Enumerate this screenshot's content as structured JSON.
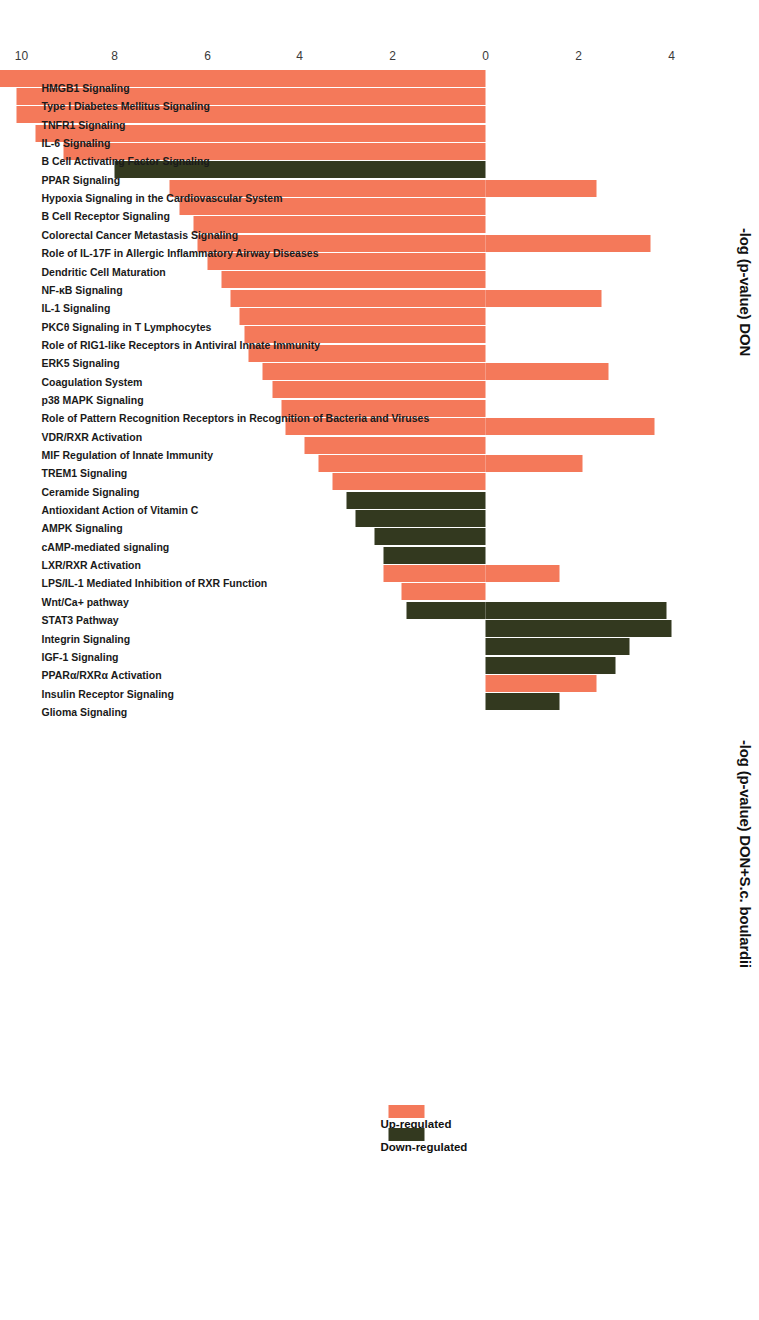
{
  "figure": {
    "left_axis_title": "-log (p-value) DON",
    "right_axis_title": "-log (p-value) DON+S.c. boulardii",
    "orientation": "rotated-90-ccw"
  },
  "legend": {
    "position": "right",
    "items": [
      {
        "label": "Up-regulated",
        "color": "#f4795a"
      },
      {
        "label": "Down-regulated",
        "color": "#33391f"
      }
    ]
  },
  "colors": {
    "up_regulated": "#f4795a",
    "down_regulated": "#33391f",
    "text": "#1a1a1a",
    "tick": "#3a3a3a",
    "background": "#ffffff"
  },
  "axis": {
    "tick_labels": [
      "4",
      "2",
      "0",
      "2",
      "4",
      "6",
      "8",
      "10",
      "12"
    ],
    "tick_values": [
      -4,
      -2,
      0,
      2,
      4,
      6,
      8,
      10,
      12
    ],
    "zero_label": "0",
    "range": [
      -4.8,
      12.4
    ]
  },
  "chart_data": {
    "type": "bar",
    "title": "",
    "subtitle": "",
    "xlabel": "",
    "ylabel": "-log (p-value)",
    "ylim": [
      -4.8,
      12.4
    ],
    "grid": false,
    "legend_position": "right",
    "axis_titles": {
      "positive_direction": "-log (p-value) DON+S.c. boulardii",
      "negative_direction": "-log (p-value) DON"
    },
    "tick_labels": [
      "4",
      "2",
      "0",
      "2",
      "4",
      "6",
      "8",
      "10",
      "12"
    ],
    "categories": [
      "HMGB1 Signaling",
      "Type I Diabetes Mellitus Signaling",
      "TNFR1 Signaling",
      "IL-6 Signaling",
      "B Cell Activating Factor Signaling",
      "PPAR Signaling",
      "Hypoxia Signaling in the Cardiovascular System",
      "B Cell Receptor Signaling",
      "Colorectal Cancer Metastasis Signaling",
      "Role of IL-17F in Allergic Inflammatory Airway Diseases",
      "Dendritic Cell Maturation",
      "NF-κB Signaling",
      "IL-1 Signaling",
      "PKCθ Signaling in T Lymphocytes",
      "Role of RIG1-like Receptors in Antiviral Innate Immunity",
      "ERK5 Signaling",
      "Coagulation System",
      "p38 MAPK Signaling",
      "Role of Pattern Recognition Receptors in Recognition of Bacteria and Viruses",
      "VDR/RXR Activation",
      "MIF Regulation of Innate Immunity",
      "TREM1 Signaling",
      "Ceramide Signaling",
      "Antioxidant Action of Vitamin C",
      "AMPK Signaling",
      "cAMP-mediated signaling",
      "LXR/RXR Activation",
      "LPS/IL-1 Mediated Inhibition of RXR Function",
      "Wnt/Ca+ pathway",
      "STAT3 Pathway",
      "Integrin Signaling",
      "IGF-1 Signaling",
      "PPARα/RXRα Activation",
      "Insulin Receptor Signaling",
      "Glioma Signaling"
    ],
    "series": [
      {
        "name": "-log (p-value) DON",
        "note": "negative direction (downward in rotated view)",
        "values": [
          11.3,
          10.1,
          10.1,
          9.7,
          9.1,
          8.0,
          6.8,
          6.6,
          6.3,
          6.2,
          6.0,
          5.7,
          5.5,
          5.3,
          5.2,
          5.1,
          4.8,
          4.6,
          4.4,
          4.3,
          3.9,
          3.6,
          3.3,
          3.0,
          2.8,
          2.4,
          2.2,
          2.2,
          1.8,
          1.7,
          0,
          0,
          0,
          0,
          0
        ]
      },
      {
        "name": "-log (p-value) DON+S.c. boulardii",
        "note": "positive direction (upward in rotated view)",
        "values": [
          0,
          0,
          0,
          0,
          0,
          0,
          2.4,
          0,
          0,
          3.55,
          0,
          0,
          2.5,
          0,
          0,
          0,
          2.65,
          0,
          0,
          3.65,
          0,
          2.1,
          0,
          0,
          0,
          0,
          0,
          1.6,
          0,
          3.9,
          4.0,
          3.1,
          2.8,
          2.4,
          1.6
        ]
      }
    ],
    "bar_direction_by_category": [
      "up",
      "up",
      "up",
      "up",
      "up",
      "down",
      "up",
      "up",
      "up",
      "up",
      "up",
      "up",
      "up",
      "up",
      "up",
      "up",
      "up",
      "up",
      "up",
      "up",
      "up",
      "up",
      "up",
      "down",
      "down",
      "down",
      "down",
      "up",
      "up",
      "down",
      "down",
      "down",
      "down",
      "up",
      "down"
    ]
  },
  "bars": [
    {
      "label": "HMGB1 Signaling",
      "color": "up",
      "neg": 11.3,
      "pos": 0
    },
    {
      "label": "Type I Diabetes Mellitus Signaling",
      "color": "up",
      "neg": 10.1,
      "pos": 0
    },
    {
      "label": "TNFR1 Signaling",
      "color": "up",
      "neg": 10.1,
      "pos": 0
    },
    {
      "label": "IL-6 Signaling",
      "color": "up",
      "neg": 9.7,
      "pos": 0
    },
    {
      "label": "B Cell Activating Factor Signaling",
      "color": "up",
      "neg": 9.1,
      "pos": 0
    },
    {
      "label": "PPAR Signaling",
      "color": "down",
      "neg": 8.0,
      "pos": 0
    },
    {
      "label": "Hypoxia Signaling in the Cardiovascular System",
      "color": "up",
      "neg": 6.8,
      "pos": 2.4
    },
    {
      "label": "B Cell Receptor Signaling",
      "color": "up",
      "neg": 6.6,
      "pos": 0
    },
    {
      "label": "Colorectal Cancer Metastasis Signaling",
      "color": "up",
      "neg": 6.3,
      "pos": 0
    },
    {
      "label": "Role of IL-17F in Allergic Inflammatory Airway Diseases",
      "color": "up",
      "neg": 6.2,
      "pos": 3.55
    },
    {
      "label": "Dendritic Cell Maturation",
      "color": "up",
      "neg": 6.0,
      "pos": 0
    },
    {
      "label": "NF-κB Signaling",
      "color": "up",
      "neg": 5.7,
      "pos": 0
    },
    {
      "label": "IL-1 Signaling",
      "color": "up",
      "neg": 5.5,
      "pos": 2.5
    },
    {
      "label": "PKCθ Signaling in T Lymphocytes",
      "color": "up",
      "neg": 5.3,
      "pos": 0
    },
    {
      "label": "Role of RIG1-like Receptors in Antiviral Innate Immunity",
      "color": "up",
      "neg": 5.2,
      "pos": 0
    },
    {
      "label": "ERK5 Signaling",
      "color": "up",
      "neg": 5.1,
      "pos": 0
    },
    {
      "label": "Coagulation System",
      "color": "up",
      "neg": 4.8,
      "pos": 2.65
    },
    {
      "label": "p38 MAPK Signaling",
      "color": "up",
      "neg": 4.6,
      "pos": 0
    },
    {
      "label": "Role of Pattern Recognition Receptors in Recognition of Bacteria and Viruses",
      "color": "up",
      "neg": 4.4,
      "pos": 0
    },
    {
      "label": "VDR/RXR Activation",
      "color": "up",
      "neg": 4.3,
      "pos": 3.65
    },
    {
      "label": "MIF Regulation of Innate Immunity",
      "color": "up",
      "neg": 3.9,
      "pos": 0
    },
    {
      "label": "TREM1 Signaling",
      "color": "up",
      "neg": 3.6,
      "pos": 2.1
    },
    {
      "label": "Ceramide Signaling",
      "color": "up",
      "neg": 3.3,
      "pos": 0
    },
    {
      "label": "Antioxidant Action of Vitamin C",
      "color": "down",
      "neg": 3.0,
      "pos": 0
    },
    {
      "label": "AMPK Signaling",
      "color": "down",
      "neg": 2.8,
      "pos": 0
    },
    {
      "label": "cAMP-mediated signaling",
      "color": "down",
      "neg": 2.4,
      "pos": 0
    },
    {
      "label": "LXR/RXR Activation",
      "color": "down",
      "neg": 2.2,
      "pos": 0
    },
    {
      "label": "LPS/IL-1 Mediated Inhibition of RXR Function",
      "color": "up",
      "neg": 2.2,
      "pos": 1.6
    },
    {
      "label": "Wnt/Ca+ pathway",
      "color": "up",
      "neg": 1.8,
      "pos": 0
    },
    {
      "label": "STAT3 Pathway",
      "color": "down",
      "neg": 1.7,
      "pos": 3.9
    },
    {
      "label": "Integrin Signaling",
      "color": "down",
      "neg": 0,
      "pos": 4.0
    },
    {
      "label": "IGF-1 Signaling",
      "color": "down",
      "neg": 0,
      "pos": 3.1
    },
    {
      "label": "PPARα/RXRα Activation",
      "color": "down",
      "neg": 0,
      "pos": 2.8
    },
    {
      "label": "Insulin Receptor Signaling",
      "color": "up",
      "neg": 0,
      "pos": 2.4
    },
    {
      "label": "Glioma Signaling",
      "color": "down",
      "neg": 0,
      "pos": 1.6
    }
  ]
}
